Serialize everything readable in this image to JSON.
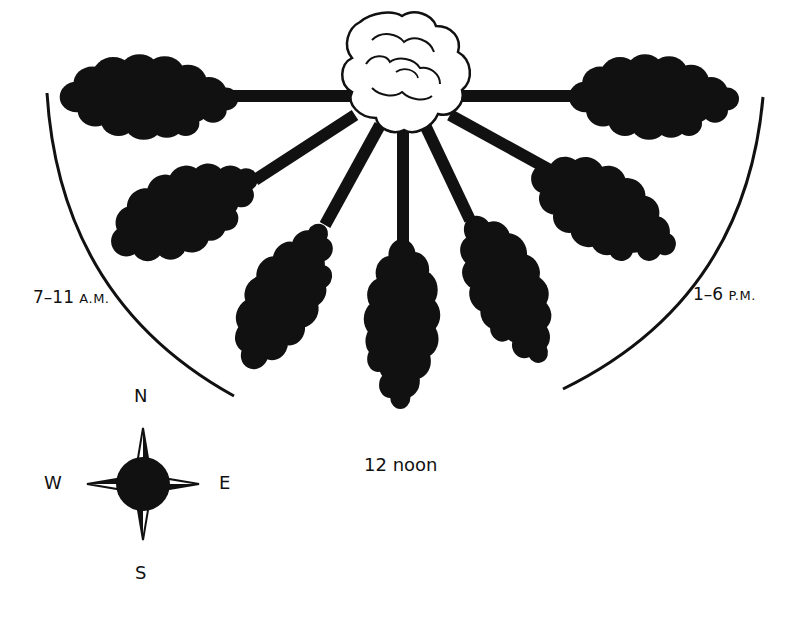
{
  "diagram": {
    "colors": {
      "shadow": "#111111",
      "background": "#ffffff",
      "tree": "#ffffff",
      "outline": "#111111"
    },
    "tree": {
      "icon": "tree-canopy-icon",
      "label": ""
    },
    "time_labels": {
      "morning": {
        "main": "7–11",
        "suffix": "A.M."
      },
      "afternoon": {
        "main": "1–6",
        "suffix": "P.M."
      },
      "noon": "12 noon"
    },
    "shadows": [
      {
        "id": "shadow-west",
        "direction": "W"
      },
      {
        "id": "shadow-wsw",
        "direction": "WSW"
      },
      {
        "id": "shadow-ssw",
        "direction": "SSW"
      },
      {
        "id": "shadow-south",
        "direction": "S"
      },
      {
        "id": "shadow-sse",
        "direction": "SSE"
      },
      {
        "id": "shadow-ese",
        "direction": "ESE"
      },
      {
        "id": "shadow-east",
        "direction": "E"
      }
    ],
    "compass": {
      "icon": "compass-rose-icon",
      "north": "N",
      "south": "S",
      "east": "E",
      "west": "W"
    }
  }
}
